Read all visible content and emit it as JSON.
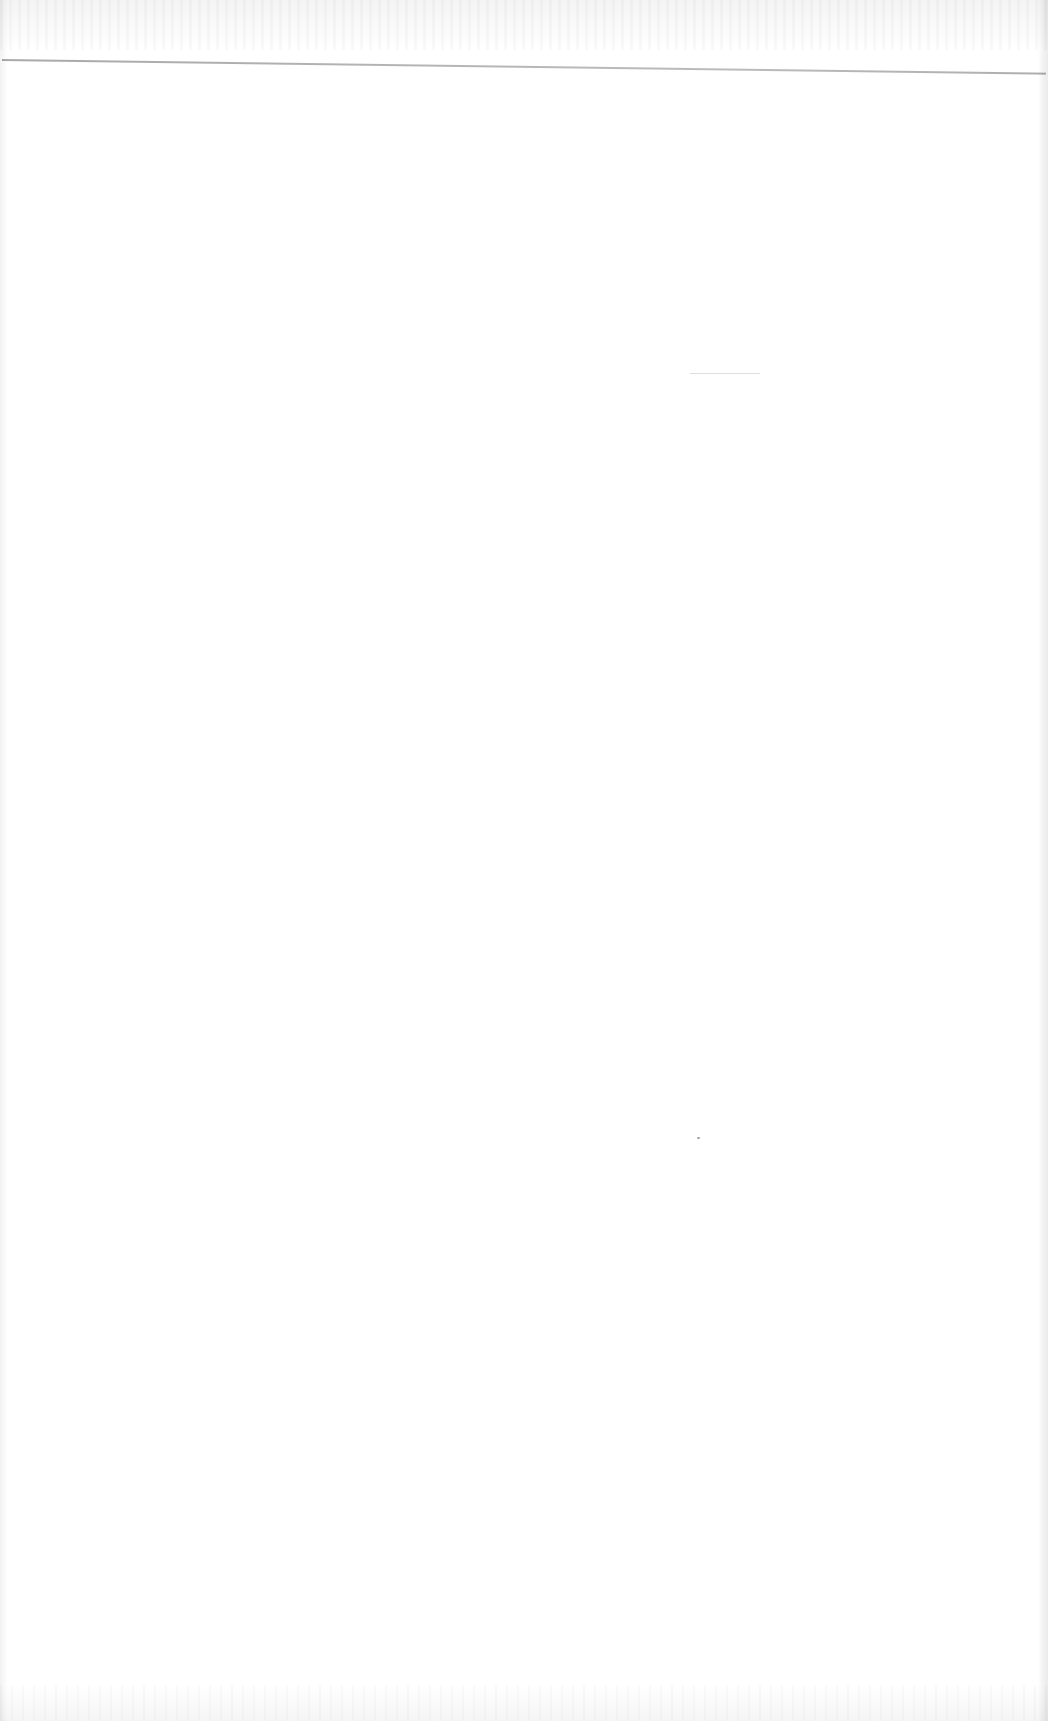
{
  "document": {
    "type": "blank-scanned-page",
    "header": {
      "text": "",
      "rule_color": "#a0a0a0"
    },
    "body_text": "",
    "footer_text": "",
    "artifacts": {
      "specks": [
        {
          "x": 697,
          "y": 1137
        }
      ],
      "faint_marks": [
        {
          "x": 690,
          "y": 373,
          "width": 70
        }
      ]
    }
  },
  "colors": {
    "background": "#ffffff",
    "rule": "#a0a0a0",
    "speck": "#8c8c8c"
  }
}
